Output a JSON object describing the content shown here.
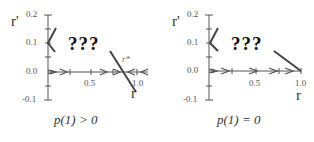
{
  "panels": [
    {
      "caption": "p(1) > 0",
      "question": "???",
      "fixed_point_label": "r*",
      "x_axis": {
        "name": "r",
        "ticks": [
          "0.5",
          "1.0"
        ]
      },
      "y_axis": {
        "name": "r'",
        "ticks": [
          "0.2",
          "0.1",
          "0.0",
          "-0.1"
        ]
      }
    },
    {
      "caption": "p(1) = 0",
      "question": "???",
      "x_axis": {
        "name": "r",
        "ticks": [
          "0.5",
          "1.0"
        ]
      },
      "y_axis": {
        "name": "r'",
        "ticks": [
          "0.2",
          "0.1",
          "0.0",
          "-0.1"
        ]
      }
    }
  ],
  "colors": {
    "line": "#555555",
    "text": "#333333"
  }
}
